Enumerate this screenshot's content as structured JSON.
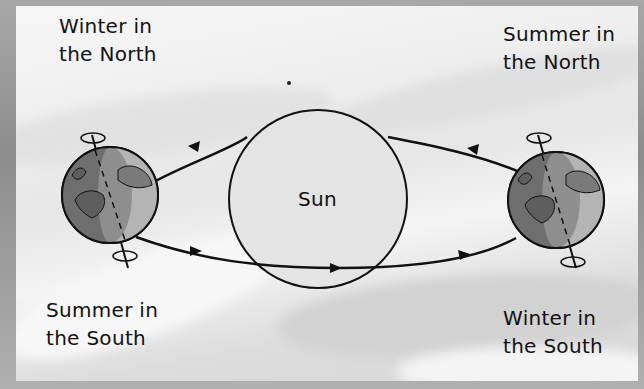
{
  "diagram": {
    "sun": {
      "label": "Sun",
      "fill": "#e4e4e4",
      "stroke": "#111111"
    },
    "labels": {
      "top_left": {
        "line1": "Winter in",
        "line2": "the North"
      },
      "top_right": {
        "line1": "Summer in",
        "line2": "the North"
      },
      "bottom_left": {
        "line1": "Summer in",
        "line2": "the South"
      },
      "bottom_right": {
        "line1": "Winter in",
        "line2": "the South"
      }
    },
    "earths": [
      {
        "position": "left",
        "tilt": "north pole tilted away from Sun",
        "icon": "earth-globe-icon"
      },
      {
        "position": "right",
        "tilt": "north pole tilted toward Sun",
        "icon": "earth-globe-icon"
      }
    ],
    "orbit": {
      "direction": "counterclockwise",
      "arrow_count": 4
    },
    "colors": {
      "border": "#9a9a9a",
      "background": "#efefef",
      "ink": "#111111",
      "earth_dark": "#6e6e6e",
      "earth_mid": "#8e8e8e",
      "earth_light": "#b4b4b4"
    }
  }
}
